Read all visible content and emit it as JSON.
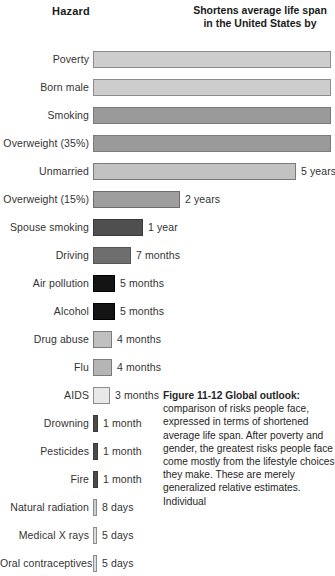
{
  "header": {
    "hazard_label": "Hazard",
    "right_line1": "Shortens average life span",
    "right_line2": "in the United States by"
  },
  "chart_data": {
    "type": "bar",
    "title": "Shortens average life span in the United States by",
    "xlabel": "",
    "ylabel": "Hazard",
    "orientation": "horizontal",
    "grid": false,
    "legend": "none",
    "categories": [
      "Poverty",
      "Born male",
      "Smoking",
      "Overweight (35%)",
      "Unmarried",
      "Overweight (15%)",
      "Spouse smoking",
      "Driving",
      "Air pollution",
      "Alcohol",
      "Drug abuse",
      "Flu",
      "AIDS",
      "Drowning",
      "Pesticides",
      "Fire",
      "Natural radiation",
      "Medical X rays",
      "Oral contraceptives"
    ],
    "value_labels": [
      "",
      "",
      "",
      "",
      "5 years",
      "2 years",
      "1 year",
      "7 months",
      "5 months",
      "5 months",
      "4 months",
      "4 months",
      "3 months",
      "1 month",
      "1 month",
      "1 month",
      "8 days",
      "5 days",
      "5 days"
    ],
    "values_months": [
      96,
      72,
      72,
      72,
      60,
      24,
      12,
      7,
      5,
      5,
      4,
      4,
      3,
      1,
      1,
      1,
      0.26,
      0.16,
      0.16
    ],
    "bars": [
      {
        "label": "Poverty",
        "value_label": "",
        "width": 238,
        "fill": "#cdcdcd",
        "border": "#8c8c8c",
        "clipped": true
      },
      {
        "label": "Born male",
        "value_label": "",
        "width": 238,
        "fill": "#cdcdcd",
        "border": "#8c8c8c",
        "clipped": true
      },
      {
        "label": "Smoking",
        "value_label": "",
        "width": 238,
        "fill": "#9a9a9a",
        "border": "#7a7a7a",
        "clipped": true
      },
      {
        "label": "Overweight (35%)",
        "value_label": "",
        "width": 238,
        "fill": "#9a9a9a",
        "border": "#7a7a7a",
        "clipped": true
      },
      {
        "label": "Unmarried",
        "value_label": "5 years",
        "width": 203,
        "fill": "#c2c2c2",
        "border": "#7a7a7a",
        "clipped": false
      },
      {
        "label": "Overweight (15%)",
        "value_label": "2 years",
        "width": 87,
        "fill": "#9e9e9e",
        "border": "#6e6e6e",
        "clipped": false
      },
      {
        "label": "Spouse smoking",
        "value_label": "1 year",
        "width": 50,
        "fill": "#4f4f4f",
        "border": "#3a3a3a",
        "clipped": false
      },
      {
        "label": "Driving",
        "value_label": "7 months",
        "width": 38,
        "fill": "#6e6e6e",
        "border": "#555555",
        "clipped": false
      },
      {
        "label": "Air pollution",
        "value_label": "5 months",
        "width": 22,
        "fill": "#141414",
        "border": "#000000",
        "clipped": false
      },
      {
        "label": "Alcohol",
        "value_label": "5 months",
        "width": 22,
        "fill": "#141414",
        "border": "#000000",
        "clipped": false
      },
      {
        "label": "Drug abuse",
        "value_label": "4 months",
        "width": 19,
        "fill": "#c0c0c0",
        "border": "#7a7a7a",
        "clipped": false
      },
      {
        "label": "Flu",
        "value_label": "4 months",
        "width": 19,
        "fill": "#b5b5b5",
        "border": "#7a7a7a",
        "clipped": false
      },
      {
        "label": "AIDS",
        "value_label": "3 months",
        "width": 17,
        "fill": "#e8e8e8",
        "border": "#8c8c8c",
        "clipped": false
      },
      {
        "label": "Drowning",
        "value_label": "1 month",
        "width": 5,
        "fill": "#4a4a4a",
        "border": "#3a3a3a",
        "clipped": false
      },
      {
        "label": "Pesticides",
        "value_label": "1 month",
        "width": 5,
        "fill": "#4a4a4a",
        "border": "#3a3a3a",
        "clipped": false
      },
      {
        "label": "Fire",
        "value_label": "1 month",
        "width": 5,
        "fill": "#4a4a4a",
        "border": "#3a3a3a",
        "clipped": false
      },
      {
        "label": "Natural radiation",
        "value_label": "8 days",
        "width": 4,
        "fill": "#cfcfcf",
        "border": "#8c8c8c",
        "clipped": false
      },
      {
        "label": "Medical X rays",
        "value_label": "5 days",
        "width": 4,
        "fill": "#dcdcdc",
        "border": "#8c8c8c",
        "clipped": false
      },
      {
        "label": "Oral contraceptives",
        "value_label": "5 days",
        "width": 4,
        "fill": "#dcdcdc",
        "border": "#8c8c8c",
        "clipped": false
      }
    ]
  },
  "caption": {
    "title": "Figure 11-12  Global outlook:",
    "body": " comparison of risks people face, expressed in terms of shortened average life span. After poverty and gender, the greatest risks people face come mostly from the lifestyle choices they make. These are merely generalized relative estimates. Individual"
  }
}
